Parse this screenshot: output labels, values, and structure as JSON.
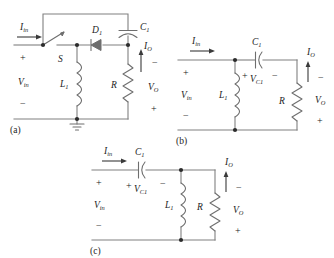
{
  "figure": {
    "kind": "circuit-schematic-figure",
    "colors": {
      "background": "#ffffff",
      "wire": "#808080",
      "component": "#6e6e6e",
      "node": "#2b2b2b",
      "text": "#1d1d1d",
      "arrow": "#3a3a3a"
    }
  },
  "circuits": [
    {
      "id": "circuit-a",
      "panel_label": "(a)",
      "components": [
        {
          "name": "switch",
          "label": "S",
          "type": "switch-open"
        },
        {
          "name": "inductor",
          "label": "L",
          "sub": "1",
          "type": "inductor"
        },
        {
          "name": "diode",
          "label": "D",
          "sub": "1",
          "type": "diode"
        },
        {
          "name": "capacitor",
          "label": "C",
          "sub": "1",
          "type": "capacitor-polarized"
        },
        {
          "name": "resistor",
          "label": "R",
          "type": "resistor"
        },
        {
          "name": "ground",
          "label": "",
          "type": "ground"
        }
      ],
      "labels": {
        "i_in": "I",
        "i_in_sub": "in",
        "v_in": "V",
        "v_in_sub": "in",
        "v_in_plus": "+",
        "v_in_minus": "−",
        "i_o": "I",
        "i_o_sub": "O",
        "v_o": "V",
        "v_o_sub": "O",
        "v_o_top_sign": "−",
        "v_o_bottom_sign": "+",
        "switch": "S",
        "inductor": "L",
        "inductor_sub": "1",
        "diode": "D",
        "diode_sub": "1",
        "capacitor": "C",
        "capacitor_sub": "1",
        "resistor": "R"
      }
    },
    {
      "id": "circuit-b",
      "panel_label": "(b)",
      "components": [
        {
          "name": "inductor",
          "label": "L",
          "sub": "1",
          "type": "inductor"
        },
        {
          "name": "capacitor",
          "label": "C",
          "sub": "1",
          "type": "capacitor-polarized"
        },
        {
          "name": "resistor",
          "label": "R",
          "type": "resistor"
        }
      ],
      "labels": {
        "i_in": "I",
        "i_in_sub": "in",
        "v_in": "V",
        "v_in_sub": "in",
        "v_in_plus": "+",
        "v_in_minus": "−",
        "i_o": "I",
        "i_o_sub": "O",
        "v_o": "V",
        "v_o_sub": "O",
        "v_o_top_sign": "−",
        "v_o_bottom_sign": "+",
        "v_c1": "V",
        "v_c1_sub": "C1",
        "v_c1_plus": "+",
        "v_c1_minus": "−",
        "inductor": "L",
        "inductor_sub": "1",
        "capacitor": "C",
        "capacitor_sub": "1",
        "resistor": "R"
      }
    },
    {
      "id": "circuit-c",
      "panel_label": "(c)",
      "components": [
        {
          "name": "capacitor",
          "label": "C",
          "sub": "1",
          "type": "capacitor-polarized"
        },
        {
          "name": "inductor",
          "label": "L",
          "sub": "1",
          "type": "inductor"
        },
        {
          "name": "resistor",
          "label": "R",
          "type": "resistor"
        }
      ],
      "labels": {
        "i_in": "I",
        "i_in_sub": "in",
        "v_in": "V",
        "v_in_sub": "in",
        "v_in_plus": "+",
        "v_in_minus": "−",
        "i_o": "I",
        "i_o_sub": "O",
        "v_o": "V",
        "v_o_sub": "O",
        "v_o_top_sign": "−",
        "v_o_bottom_sign": "+",
        "v_c1": "V",
        "v_c1_sub": "C1",
        "v_c1_plus": "+",
        "v_c1_minus": "−",
        "inductor": "L",
        "inductor_sub": "1",
        "capacitor": "C",
        "capacitor_sub": "1",
        "resistor": "R"
      }
    }
  ]
}
